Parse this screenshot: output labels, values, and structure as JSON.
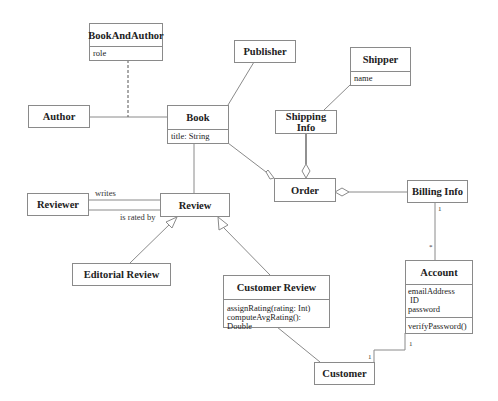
{
  "classes": {
    "book_and_author": {
      "name": "BookAndAuthor",
      "attributes": [
        "role"
      ]
    },
    "publisher": {
      "name": "Publisher"
    },
    "shipper": {
      "name": "Shipper",
      "attributes": [
        "name"
      ]
    },
    "author": {
      "name": "Author"
    },
    "book": {
      "name": "Book",
      "attributes": [
        "title: String"
      ]
    },
    "shipping_info": {
      "name": "Shipping Info"
    },
    "order": {
      "name": "Order"
    },
    "billing_info": {
      "name": "Billing Info"
    },
    "reviewer": {
      "name": "Reviewer"
    },
    "review": {
      "name": "Review"
    },
    "editorial_review": {
      "name": "Editorial Review"
    },
    "customer_review": {
      "name": "Customer Review",
      "operations": [
        "assignRating(rating: Int)",
        "computeAvgRating(): Double"
      ]
    },
    "account": {
      "name": "Account",
      "attributes": [
        "emailAddress",
        "ID",
        "password"
      ],
      "operations": [
        "verifyPassword()"
      ]
    },
    "customer": {
      "name": "Customer"
    }
  },
  "associations": {
    "writes": "writes",
    "is_rated_by": "is rated by",
    "billing_account_billing_mult": "1",
    "billing_account_account_mult": "*",
    "account_customer_account_mult": "1",
    "account_customer_customer_mult": "1"
  },
  "colors": {
    "line": "#8a8a8a",
    "border": "#8a8a8a",
    "text": "#222222",
    "background": "#ffffff"
  }
}
